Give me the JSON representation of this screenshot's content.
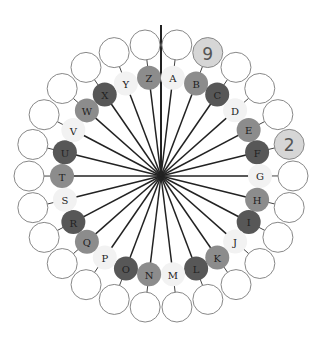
{
  "diagram": {
    "type": "cipher-wheel",
    "center": {
      "x": 161,
      "y": 176
    },
    "inner_ring_radius": 99,
    "outer_ring_radius": 132,
    "inner_circle_radius": 12,
    "outer_circle_radius": 15,
    "start_angle_deg": 6.9,
    "pointer_line": {
      "x": 161,
      "y_top": 25
    },
    "shades": {
      "light": "#f2f2f2",
      "medium": "#8c8c8c",
      "dark": "#575757",
      "highlight": "#d6d6d6",
      "outline": "#888888",
      "spoke": "#222222"
    },
    "letters": [
      {
        "label": "A",
        "shade": "light",
        "outer_value": ""
      },
      {
        "label": "B",
        "shade": "medium",
        "outer_value": "9"
      },
      {
        "label": "C",
        "shade": "dark",
        "outer_value": ""
      },
      {
        "label": "D",
        "shade": "light",
        "outer_value": ""
      },
      {
        "label": "E",
        "shade": "medium",
        "outer_value": ""
      },
      {
        "label": "F",
        "shade": "dark",
        "outer_value": "2"
      },
      {
        "label": "G",
        "shade": "light",
        "outer_value": ""
      },
      {
        "label": "H",
        "shade": "medium",
        "outer_value": ""
      },
      {
        "label": "I",
        "shade": "dark",
        "outer_value": ""
      },
      {
        "label": "J",
        "shade": "light",
        "outer_value": ""
      },
      {
        "label": "K",
        "shade": "medium",
        "outer_value": ""
      },
      {
        "label": "L",
        "shade": "dark",
        "outer_value": ""
      },
      {
        "label": "M",
        "shade": "light",
        "outer_value": ""
      },
      {
        "label": "N",
        "shade": "medium",
        "outer_value": ""
      },
      {
        "label": "O",
        "shade": "dark",
        "outer_value": ""
      },
      {
        "label": "P",
        "shade": "light",
        "outer_value": ""
      },
      {
        "label": "Q",
        "shade": "medium",
        "outer_value": ""
      },
      {
        "label": "R",
        "shade": "dark",
        "outer_value": ""
      },
      {
        "label": "S",
        "shade": "light",
        "outer_value": ""
      },
      {
        "label": "T",
        "shade": "medium",
        "outer_value": ""
      },
      {
        "label": "U",
        "shade": "dark",
        "outer_value": ""
      },
      {
        "label": "V",
        "shade": "light",
        "outer_value": ""
      },
      {
        "label": "W",
        "shade": "medium",
        "outer_value": ""
      },
      {
        "label": "X",
        "shade": "dark",
        "outer_value": ""
      },
      {
        "label": "Y",
        "shade": "light",
        "outer_value": ""
      },
      {
        "label": "Z",
        "shade": "medium",
        "outer_value": ""
      }
    ]
  }
}
